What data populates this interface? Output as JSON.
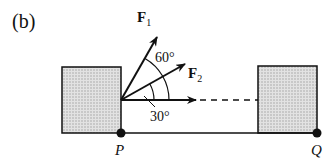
{
  "figure": {
    "panel_label": "(b)",
    "forces": [
      {
        "name": "F",
        "subscript": "1",
        "angle_from_horizontal_deg": 60
      },
      {
        "name": "F",
        "subscript": "2",
        "angle_from_horizontal_deg": 30
      }
    ],
    "angle_labels": {
      "upper": "60°",
      "lower": "30°"
    },
    "points": {
      "left": "P",
      "right": "Q"
    },
    "colors": {
      "box_fill": "#d4d4d4",
      "stroke": "#111111"
    }
  }
}
